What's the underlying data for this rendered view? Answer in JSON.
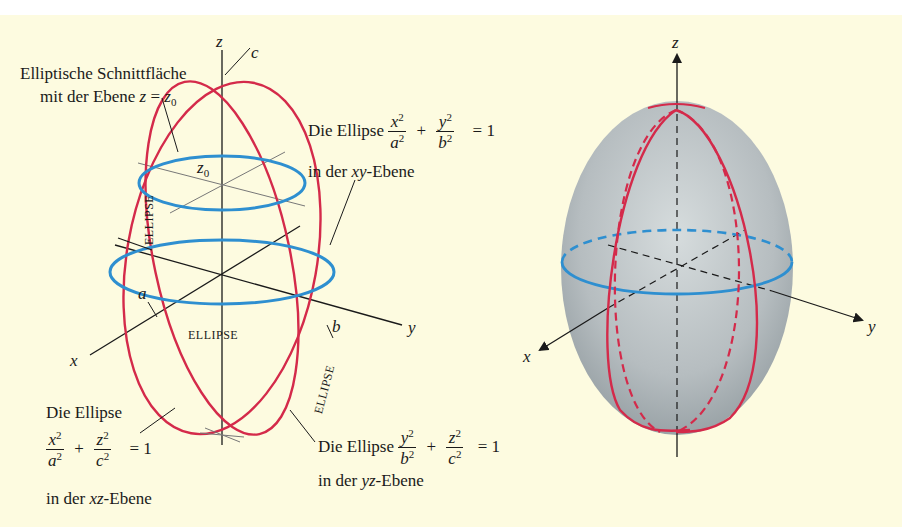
{
  "left_figure": {
    "axis_labels": {
      "z": "z",
      "x": "x",
      "y": "y"
    },
    "point_labels": {
      "a": "a",
      "b": "b",
      "c": "c",
      "z0": "z",
      "z0_sub": "0"
    },
    "curve_tags": {
      "horizontal": "ELLIPSE",
      "vertical_front": "ELLIPSE",
      "vertical_side": "ELLIPSE"
    },
    "cross_section": {
      "line1": "Elliptische Schnittfläche",
      "line2_prefix": "mit der Ebene ",
      "line2_eq_lhs": "z",
      "line2_eq_op": " = ",
      "line2_eq_rhs": "z",
      "line2_eq_rhs_sub": "0"
    },
    "xy_ellipse": {
      "prefix": "Die Ellipse ",
      "term1_num": "x",
      "term1_den": "a",
      "plus": "+",
      "term2_num": "y",
      "term2_den": "b",
      "exp": "2",
      "equals": "= 1",
      "line2_prefix": "in der ",
      "line2_plane": "xy",
      "line2_suffix": "-Ebene"
    },
    "xz_ellipse": {
      "line1": "Die Ellipse",
      "term1_num": "x",
      "term1_den": "a",
      "plus": "+",
      "term2_num": "z",
      "term2_den": "c",
      "exp": "2",
      "equals": "= 1",
      "line3_prefix": "in der ",
      "line3_plane": "xz",
      "line3_suffix": "-Ebene"
    },
    "yz_ellipse": {
      "prefix": "Die Ellipse ",
      "term1_num": "y",
      "term1_den": "b",
      "plus": "+",
      "term2_num": "z",
      "term2_den": "c",
      "exp": "2",
      "equals": "= 1",
      "line2_prefix": "in der ",
      "line2_plane": "yz",
      "line2_suffix": "-Ebene"
    }
  },
  "right_figure": {
    "axis_labels": {
      "z": "z",
      "x": "x",
      "y": "y"
    }
  },
  "colors": {
    "background": "#fdfbe0",
    "red_curve": "#d42a4a",
    "blue_curve": "#2e8fd0",
    "axis": "#1a1a1a",
    "surface": "#b9bfc2"
  }
}
